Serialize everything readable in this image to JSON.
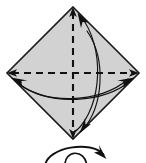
{
  "figure": {
    "title": "Origami step: fold square diagonals (valley creases) then turn over",
    "type": "origami-instruction-diagram",
    "canvas": {
      "width": 146,
      "height": 163
    },
    "colors": {
      "paper_fill": "#d2d2d2",
      "paper_stroke": "#1a1a1a",
      "crease_line": "#111111",
      "arrow_line": "#111111",
      "background": "#ffffff"
    },
    "shape": {
      "name": "square-rotated-diamond",
      "vertices": {
        "top": {
          "x": 73,
          "y": 7
        },
        "right": {
          "x": 139,
          "y": 73
        },
        "bottom": {
          "x": 73,
          "y": 139
        },
        "left": {
          "x": 7,
          "y": 73
        }
      },
      "stroke_width": 1.6
    },
    "creases": [
      {
        "name": "vertical-crease",
        "style": "dashed",
        "meaning": "valley fold",
        "from": {
          "x": 73,
          "y": 9
        },
        "to": {
          "x": 73,
          "y": 137
        },
        "dash": "7,5"
      },
      {
        "name": "horizontal-crease",
        "style": "dashed",
        "meaning": "valley fold",
        "from": {
          "x": 9,
          "y": 73
        },
        "to": {
          "x": 137,
          "y": 73
        },
        "dash": "7,5"
      }
    ],
    "crease_arrowheads": [
      {
        "name": "crease-arrow-up",
        "at": {
          "x": 73,
          "y": 7
        },
        "direction": "up"
      },
      {
        "name": "crease-arrow-down",
        "at": {
          "x": 73,
          "y": 139
        },
        "direction": "down"
      },
      {
        "name": "crease-arrow-left",
        "at": {
          "x": 7,
          "y": 73
        },
        "direction": "left"
      },
      {
        "name": "crease-arrow-right",
        "at": {
          "x": 139,
          "y": 73
        },
        "direction": "right"
      }
    ],
    "fold_arrows": [
      {
        "name": "fold-arrow-vertical",
        "meaning": "bring bottom corner up to top corner",
        "path": "M 77 132 C 104 104, 104 44, 80 16",
        "arrowhead": {
          "x": 78,
          "y": 14,
          "angle": -130
        }
      },
      {
        "name": "fold-arrow-vertical-return",
        "meaning": "bring top corner down to bottom corner",
        "path": "M 88 33 C 108 62, 104 106, 82 129",
        "arrowhead": {
          "x": 80,
          "y": 131,
          "angle": 48
        }
      },
      {
        "name": "fold-arrow-horizontal",
        "meaning": "bring right corner left to left corner",
        "path": "M 130 80 C 100 104, 40 104, 14 80",
        "arrowhead": {
          "x": 12,
          "y": 78,
          "angle": 223
        }
      },
      {
        "name": "fold-arrow-horizontal-return",
        "meaning": "bring left corner right to right corner",
        "path": "M 20 84 C 52 106, 104 102, 132 80",
        "arrowhead": {
          "x": 134,
          "y": 78,
          "angle": -38
        }
      }
    ],
    "turn_over_symbol": {
      "name": "turn-over-symbol",
      "label": "turn model over",
      "arc_path": "M 46 163 C 50 146, 95 142, 104 156",
      "arrowhead": {
        "x": 105,
        "y": 158,
        "angle": 58
      },
      "inner_path": "M 66 163 C 66 150, 84 150, 86 163",
      "position": {
        "x": 45,
        "y": 142,
        "width": 62,
        "height": 21
      }
    }
  }
}
